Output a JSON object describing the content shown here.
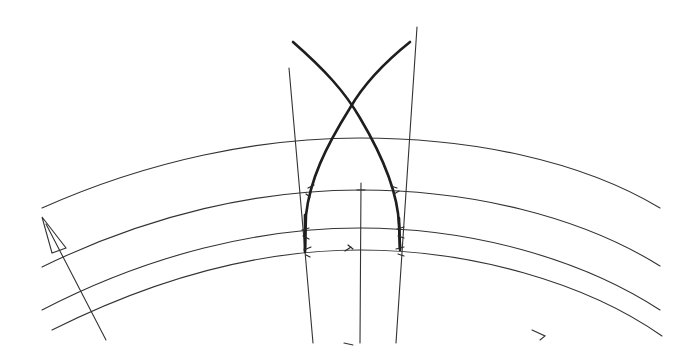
{
  "diagram": {
    "type": "hand-drawn construction sketch",
    "colors": {
      "background": "#ffffff",
      "line": "#333333",
      "bold_line": "#1e1e1e"
    },
    "concentric_arcs": [
      {
        "id": "arc-1",
        "left": [
          42,
          208
        ],
        "peak": [
          360,
          138
        ],
        "right": [
          660,
          208
        ]
      },
      {
        "id": "arc-2",
        "left": [
          42,
          267
        ],
        "peak": [
          360,
          190
        ],
        "right": [
          660,
          266
        ]
      },
      {
        "id": "arc-3",
        "left": [
          42,
          310
        ],
        "peak": [
          360,
          228
        ],
        "right": [
          660,
          310
        ]
      },
      {
        "id": "arc-4",
        "left": [
          52,
          330
        ],
        "peak": [
          360,
          250
        ],
        "right": [
          662,
          336
        ]
      }
    ],
    "guide_lines": [
      {
        "id": "left-guide",
        "from": [
          289,
          68
        ],
        "to": [
          313,
          343
        ]
      },
      {
        "id": "right-guide",
        "from": [
          417,
          27
        ],
        "to": [
          396,
          343
        ]
      },
      {
        "id": "center-line",
        "from": [
          361,
          183
        ],
        "to": [
          360,
          343
        ]
      }
    ],
    "arch_curves": [
      {
        "id": "arch-curve-left-rising",
        "from": [
          293,
          42
        ],
        "through": [
          352,
          108
        ],
        "to": [
          400,
          248
        ]
      },
      {
        "id": "arch-curve-right-rising",
        "from": [
          410,
          42
        ],
        "through": [
          352,
          108
        ],
        "to": [
          305,
          250
        ]
      }
    ],
    "arch_apex": [
      352,
      108
    ],
    "arrow": {
      "tip": [
        42,
        217
      ],
      "tail": [
        106,
        340
      ]
    },
    "marks": [
      {
        "id": "chevron-mark",
        "glyph": ">",
        "position": [
          533,
          330
        ]
      },
      {
        "id": "dash-mark",
        "glyph": "-",
        "position": [
          346,
          342
        ]
      }
    ]
  }
}
